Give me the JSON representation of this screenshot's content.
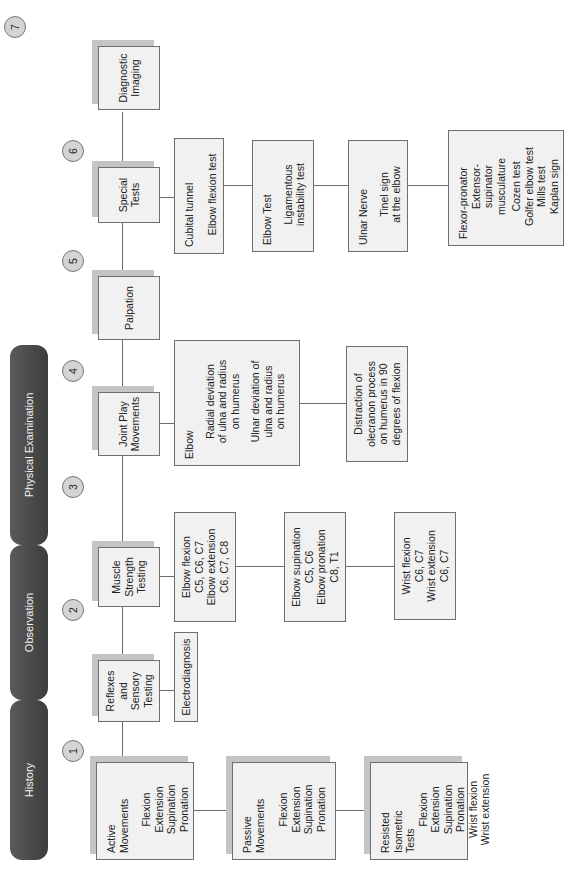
{
  "phases": [
    {
      "label": "History"
    },
    {
      "label": "Observation"
    },
    {
      "label": "Physical Examination"
    }
  ],
  "steps": [
    {
      "number": "1"
    },
    {
      "number": "2"
    },
    {
      "number": "3"
    },
    {
      "number": "4"
    },
    {
      "number": "5"
    },
    {
      "number": "6"
    },
    {
      "number": "7"
    }
  ],
  "main_boxes": {
    "reflexes": {
      "title": [
        "Reflexes",
        "and",
        "Sensory",
        "Testing"
      ]
    },
    "muscle": {
      "title": [
        "Muscle",
        "Strength",
        "Testing"
      ]
    },
    "joint_play": {
      "title": [
        "Joint Play",
        "Movements"
      ]
    },
    "palpation": {
      "title": [
        "Palpation"
      ]
    },
    "special": {
      "title": [
        "Special",
        "Tests"
      ]
    },
    "imaging": {
      "title": [
        "Diagnostic",
        "Imaging"
      ]
    }
  },
  "movements": [
    {
      "title": [
        "Active",
        "Movements"
      ],
      "items": [
        "Flexion",
        "Extension",
        "Supination",
        "Pronation"
      ]
    },
    {
      "title": [
        "Passive",
        "Movements"
      ],
      "items": [
        "Flexion",
        "Extension",
        "Supination",
        "Pronation"
      ]
    },
    {
      "title": [
        "Resisted",
        "Isometric",
        "Tests"
      ],
      "items": [
        "Flexion",
        "Extension",
        "Supination",
        "Pronation",
        "Wrist flexion",
        "Wrist extension"
      ]
    }
  ],
  "reflexes_sub": {
    "label": "Electrodiagnosis"
  },
  "muscle_sub": [
    {
      "lines": [
        "Elbow flexion",
        "C5, C6, C7",
        "Elbow extension",
        "C6, C7, C8"
      ]
    },
    {
      "lines": [
        "Elbow supination",
        "C5, C6",
        "Elbow pronation",
        "C8, T1"
      ]
    },
    {
      "lines": [
        "Wrist flexion",
        "C6, C7",
        "Wrist extension",
        "C6, C7"
      ]
    }
  ],
  "joint_play_sub": [
    {
      "heading": "Elbow",
      "lines": [
        "Radial deviation",
        "of ulna and radius",
        "on humerus"
      ],
      "lines2": [
        "Ulnar deviation of",
        "ulna and radius",
        "on humerus"
      ]
    },
    {
      "lines": [
        "Distraction of",
        "olecranon process",
        "on humerus in 90",
        "degrees of flexion"
      ]
    }
  ],
  "special_sub": [
    {
      "heading": "Cubital tunnel",
      "lines": [
        "Elbow flexion test"
      ]
    },
    {
      "heading": "Elbow Test",
      "lines": [
        "Ligamentous",
        "instability test"
      ]
    },
    {
      "heading": "Ulnar Nerve",
      "lines": [
        "Tinel sign",
        "at the elbow"
      ]
    },
    {
      "heading": [
        "Flexor-pronator",
        "Extensor-",
        "supinator",
        "musculature"
      ],
      "lines": [
        "Cozen test",
        "Golfer elbow test",
        "Mills test",
        "Kaplan sign"
      ]
    }
  ]
}
